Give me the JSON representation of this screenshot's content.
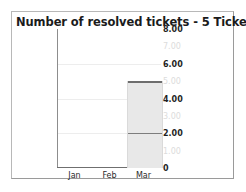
{
  "chart_data": {
    "type": "bar",
    "title": "Number of resolved tickets - 5 Ticket(s)",
    "xlabel": "",
    "ylabel": "",
    "categories": [
      "Jan",
      "Feb",
      "Mar"
    ],
    "values": [
      0,
      0,
      5
    ],
    "series": [
      {
        "name": "segment-lower",
        "values": [
          0,
          0,
          2
        ]
      },
      {
        "name": "segment-upper",
        "values": [
          0,
          0,
          3
        ]
      }
    ],
    "stacked": true,
    "ylim": [
      0,
      8
    ],
    "ytick_labels": [
      "8.00",
      "7.00",
      "6.00",
      "5.00",
      "4.00",
      "3.00",
      "2.00",
      "1.00",
      "0"
    ],
    "ytick_values": [
      8,
      7,
      6,
      5,
      4,
      3,
      2,
      1,
      0
    ],
    "ytick_emphasis": [
      "major",
      "minor",
      "major",
      "minor",
      "major",
      "minor",
      "major",
      "minor",
      "major"
    ],
    "ytick_side": "right",
    "gridlines_at": [
      6,
      4,
      2
    ],
    "grid": true,
    "legend": "none",
    "bar_fill_color": "#e8e8e8",
    "bar_outline_color": "#6d6d6d",
    "gridline_color": "#ededed",
    "axis_color": "#8d8d8d",
    "title_color": "#1b1b1b",
    "background_color": "#ffffff"
  },
  "frame": {
    "border_color": "#b8b8b8"
  }
}
